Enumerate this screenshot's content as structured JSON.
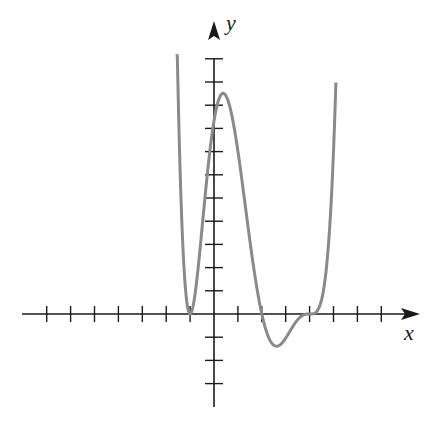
{
  "chart_data": {
    "type": "line",
    "title": "",
    "xlabel": "x",
    "ylabel": "y",
    "grid": false,
    "legend": null,
    "axis_style": "cartesian-arrows-through-origin",
    "x_ticks": [
      -7,
      -6,
      -5,
      -4,
      -3,
      -2,
      -1,
      1,
      2,
      3,
      4,
      5,
      6,
      7
    ],
    "y_ticks": [
      -3,
      -2,
      -1,
      1,
      2,
      3,
      4,
      5,
      6,
      7,
      8,
      9,
      10,
      11
    ],
    "tick_labels_shown": false,
    "xlim": [
      -8,
      8.5
    ],
    "ylim": [
      -4,
      13
    ],
    "series": [
      {
        "name": "f(x)",
        "color": "#8a8a8a",
        "description": "Polynomial with double root at x=-1, simple root at x=2, triple (inflection) root at x=4",
        "points": [
          {
            "x": -1.55,
            "y": 11.0
          },
          {
            "x": -1.0,
            "y": 0
          },
          {
            "x": 0,
            "y": 8.3
          },
          {
            "x": 0.45,
            "y": 9.3
          },
          {
            "x": 1.0,
            "y": 7.0
          },
          {
            "x": 2.0,
            "y": 0
          },
          {
            "x": 2.75,
            "y": -1.3
          },
          {
            "x": 4.0,
            "y": 0
          },
          {
            "x": 5.1,
            "y": 11.0
          }
        ]
      }
    ]
  },
  "labels": {
    "x_axis": "x",
    "y_axis": "y"
  }
}
